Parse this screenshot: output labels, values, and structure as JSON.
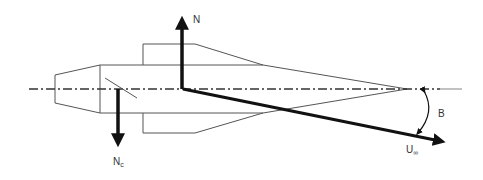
{
  "diagram": {
    "type": "force-diagram",
    "colors": {
      "background": "#ffffff",
      "outline": "#555555",
      "vector": "#111111",
      "label": "#333333"
    },
    "labels": {
      "normal_force": {
        "main": "N",
        "sub": ""
      },
      "control_force": {
        "main": "N",
        "sub": "c"
      },
      "freestream_velocity": {
        "main": "U",
        "sub": "∞"
      },
      "angle": {
        "main": "B",
        "sub": ""
      }
    },
    "vectors": [
      {
        "name": "N",
        "direction": "up",
        "origin": [
          182,
          89
        ],
        "tip": [
          182,
          15
        ]
      },
      {
        "name": "Nc",
        "direction": "down",
        "origin": [
          118,
          89
        ],
        "tip": [
          118,
          148
        ]
      },
      {
        "name": "U∞",
        "direction": "down-right",
        "origin": [
          182,
          89
        ],
        "tip": [
          447,
          143
        ]
      }
    ]
  }
}
